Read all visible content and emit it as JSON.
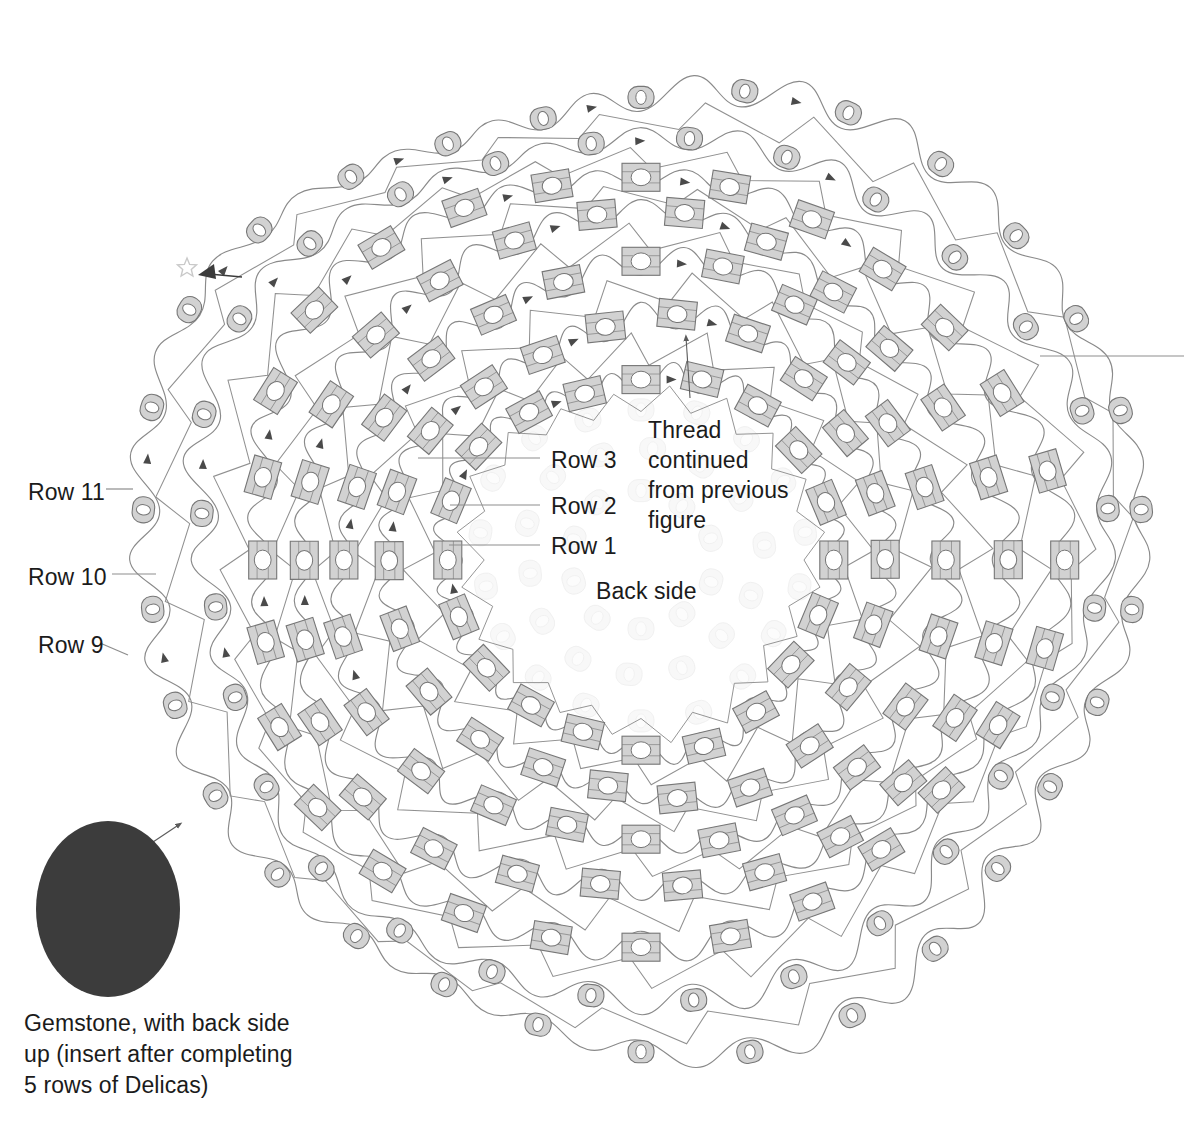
{
  "figure": {
    "kind": "beadwork-stitch-diagram",
    "background": "#ffffff"
  },
  "labels": {
    "row11": "Row 11",
    "row10": "Row 10",
    "row9": "Row 9",
    "row3": "Row 3",
    "row2": "Row 2",
    "row1": "Row 1",
    "thread_note": "Thread\ncontinued\nfrom previous\nfigure",
    "back_side": "Back side",
    "gemstone_caption": "Gemstone, with back side\nup (insert after completing\n5 rows of Delicas)"
  },
  "label_positions": {
    "row11": {
      "x": 28,
      "y": 478
    },
    "row10": {
      "x": 28,
      "y": 563
    },
    "row9": {
      "x": 38,
      "y": 631
    },
    "row3": {
      "x": 551,
      "y": 446
    },
    "row2": {
      "x": 551,
      "y": 492
    },
    "row1": {
      "x": 551,
      "y": 532
    },
    "thread_note": {
      "x": 648,
      "y": 415
    },
    "back_side": {
      "x": 596,
      "y": 577
    },
    "gemstone_caption": {
      "x": 24,
      "y": 1008
    }
  },
  "leaders": [
    {
      "name": "leader-row11",
      "x1": 106,
      "y1": 489,
      "x2": 133,
      "y2": 489
    },
    {
      "name": "leader-row10",
      "x1": 112,
      "y1": 574,
      "x2": 156,
      "y2": 574
    },
    {
      "name": "leader-row9",
      "x1": 100,
      "y1": 643,
      "x2": 128,
      "y2": 655
    },
    {
      "name": "leader-row3",
      "x1": 418,
      "y1": 458,
      "x2": 540,
      "y2": 458
    },
    {
      "name": "leader-row2",
      "x1": 450,
      "y1": 505,
      "x2": 540,
      "y2": 505
    },
    {
      "name": "leader-row1",
      "x1": 449,
      "y1": 545,
      "x2": 540,
      "y2": 545
    },
    {
      "name": "leader-right-edge",
      "x1": 1040,
      "y1": 356,
      "x2": 1184,
      "y2": 356
    }
  ],
  "gemstone": {
    "cx": 108,
    "cy": 909,
    "rx": 72,
    "ry": 88,
    "fill": "#3c3c3c",
    "arrow": {
      "x1": 144,
      "y1": 848,
      "x2": 180,
      "y2": 824
    }
  },
  "thread_note_arrow": {
    "x1": 690,
    "y1": 398,
    "x2": 686,
    "y2": 337
  },
  "start_marker": {
    "star": {
      "cx": 187,
      "cy": 268,
      "r": 10
    },
    "arrow": {
      "x1": 242,
      "y1": 277,
      "x2": 200,
      "y2": 272
    }
  },
  "colors": {
    "bead_fill": "#d2d2d2",
    "bead_stroke": "#767676",
    "bead_hole": "#ffffff",
    "ghost_fill": "#f2f2f2",
    "ghost_stroke": "#e2e2e2",
    "thread": "#8a8a8a",
    "thread_dark": "#5b5b5b",
    "arrowhead": "#4a4a4a",
    "leader": "#8d8d8d",
    "text": "#1b1b1b",
    "gemstone": "#3c3c3c"
  },
  "geometry": {
    "center": {
      "x": 641,
      "y": 560
    },
    "aspect_x": 1.0,
    "aspect_y": 0.96,
    "rings": [
      {
        "name": "ring-1-delica",
        "radius": 193,
        "count": 20,
        "type": "delica",
        "phase": 0.0,
        "opacity": 1.0
      },
      {
        "name": "ring-2-delica",
        "radius": 248,
        "count": 22,
        "type": "delica",
        "phase": 0.14,
        "opacity": 1.0
      },
      {
        "name": "ring-3-delica",
        "radius": 301,
        "count": 24,
        "type": "delica",
        "phase": 0.0,
        "opacity": 1.0
      },
      {
        "name": "ring-4-delica",
        "radius": 352,
        "count": 26,
        "type": "delica",
        "phase": 0.12,
        "opacity": 1.0
      },
      {
        "name": "ring-5-delica",
        "radius": 401,
        "count": 28,
        "type": "delica",
        "phase": 0.0,
        "opacity": 1.0
      },
      {
        "name": "ring-6-seed",
        "radius": 449,
        "count": 28,
        "type": "seed",
        "phase": 0.11,
        "opacity": 1.0
      },
      {
        "name": "ring-7-seed",
        "radius": 497,
        "count": 30,
        "type": "seed",
        "phase": 0.0,
        "opacity": 1.0
      }
    ],
    "ghost_rings": [
      {
        "name": "ghost-ring-1",
        "radius": 72,
        "count": 10,
        "type": "seed",
        "phase": 0.0,
        "opacity": 0.5
      },
      {
        "name": "ghost-ring-2",
        "radius": 118,
        "count": 14,
        "type": "seed",
        "phase": 0.1,
        "opacity": 0.5
      },
      {
        "name": "ghost-ring-3",
        "radius": 162,
        "count": 18,
        "type": "seed",
        "phase": 0.0,
        "opacity": 0.5
      }
    ],
    "bead_size": {
      "delica_w": 38,
      "delica_h": 28,
      "seed_w": 26,
      "seed_h": 22
    }
  },
  "arrow_sector": {
    "start_deg": 150,
    "end_deg": 300
  },
  "chart_data": {
    "type": "diagram",
    "rows_labeled": [
      "Row 1",
      "Row 2",
      "Row 3",
      "Row 9",
      "Row 10",
      "Row 11"
    ],
    "bead_types": [
      "Delica (rectangular)",
      "Seed (round)"
    ],
    "ring_counts": [
      20,
      22,
      24,
      26,
      28,
      28,
      30
    ],
    "notes": [
      "Thread continued from previous figure",
      "Back side",
      "Gemstone, with back side up (insert after completing 5 rows of Delicas)"
    ]
  }
}
